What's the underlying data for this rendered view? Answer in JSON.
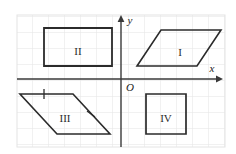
{
  "figure": {
    "title": "",
    "background_color": "#ffffff",
    "grid": {
      "visible": true,
      "color": "#e3e3e3",
      "spacing_px": 16,
      "left_px": 17,
      "top_px": 13,
      "right_px": 225,
      "bottom_px": 147
    },
    "axes": {
      "color": "#3a3a3a",
      "origin_px": {
        "x": 121,
        "y": 79
      },
      "x_axis_label": "x",
      "y_axis_label": "y",
      "origin_label": "O",
      "x_arrow": true,
      "y_arrow": true
    },
    "shape_color": "#2b2b2b",
    "shape_stroke_width": 1.6,
    "shapes": [
      {
        "label": "I",
        "type": "parallelogram",
        "quadrant": 1,
        "points": "137,66 161,30 221,30 197,66",
        "label_px": {
          "x": 180,
          "y": 52
        }
      },
      {
        "label": "II",
        "type": "rectangle",
        "quadrant": 2,
        "points": "44,28 112,28 112,66 44,66",
        "label_px": {
          "x": 78,
          "y": 51
        }
      },
      {
        "label": "III",
        "type": "parallelogram",
        "quadrant": 3,
        "points": "20,94 73,94 110,134 57,134",
        "label_px": {
          "x": 65,
          "y": 118
        },
        "tick_marks": [
          {
            "on_edge": "top",
            "x": 44,
            "y": 94,
            "angle_deg": 0
          },
          {
            "on_edge": "right",
            "x": 91,
            "y": 114,
            "angle_deg": 47
          }
        ]
      },
      {
        "label": "IV",
        "type": "square",
        "quadrant": 4,
        "points": "146,94 186,94 186,134 146,134",
        "label_px": {
          "x": 166,
          "y": 118
        }
      }
    ]
  }
}
